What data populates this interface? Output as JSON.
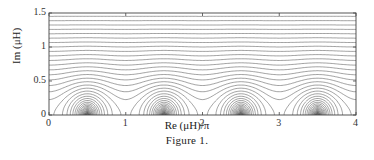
{
  "chart_data": {
    "type": "contour",
    "title": "",
    "caption": "Figure 1.",
    "xlabel": "Re (μH)/π",
    "ylabel": "Im (μH)",
    "xlim": [
      0,
      4
    ],
    "ylim": [
      0,
      1.5
    ],
    "xticks": [
      "0",
      "1",
      "2",
      "3",
      "4"
    ],
    "yticks": [
      "0",
      "0.5",
      "1",
      "1.5"
    ],
    "grid": false,
    "legend": null,
    "lobe_centers_x": [
      0.5,
      1.5,
      2.5,
      3.5
    ],
    "saddle_x": [
      0,
      1,
      2,
      3,
      4
    ]
  },
  "labels": {
    "x_axis": "Re (μH)/π",
    "y_axis": "Im (μH)",
    "caption": "Figure 1."
  },
  "ticks": {
    "x": [
      "0",
      "1",
      "2",
      "3",
      "4"
    ],
    "y": [
      "0",
      "0.5",
      "1",
      "1.5"
    ]
  }
}
